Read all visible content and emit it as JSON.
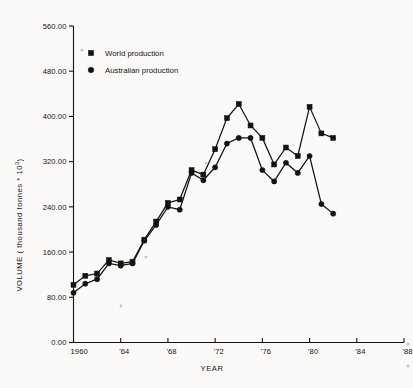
{
  "chart_data": {
    "type": "line",
    "title": "",
    "xlabel": "YEAR",
    "ylabel": "VOLUME ( thousand tonnes * 10",
    "ylabel_exponent": "3",
    "ylabel_suffix": ")",
    "xlim": [
      1960,
      1988
    ],
    "ylim": [
      0,
      560
    ],
    "grid": false,
    "legend_position": "top-left",
    "x_tick_labels": [
      "1960",
      "'64",
      "'68",
      "'72",
      "'76",
      "'80",
      "'84",
      "'88"
    ],
    "x_tick_values": [
      1960,
      1964,
      1968,
      1972,
      1976,
      1980,
      1984,
      1988
    ],
    "y_tick_labels": [
      "0.00",
      "80.00",
      "160.00",
      "240.00",
      "320.00",
      "400.00",
      "480.00",
      "560.00"
    ],
    "y_tick_values": [
      0,
      80,
      160,
      240,
      320,
      400,
      480,
      560
    ],
    "x": [
      1960,
      1961,
      1962,
      1963,
      1964,
      1965,
      1966,
      1967,
      1968,
      1969,
      1970,
      1971,
      1972,
      1973,
      1974,
      1975,
      1976,
      1977,
      1978,
      1979,
      1980,
      1981,
      1982
    ],
    "series": [
      {
        "name": "World production",
        "marker": "square",
        "values": [
          102,
          118,
          122,
          146,
          140,
          143,
          182,
          214,
          247,
          253,
          305,
          297,
          342,
          397,
          422,
          384,
          362,
          315,
          345,
          330,
          417,
          370,
          362
        ]
      },
      {
        "name": "Australian production",
        "marker": "circle",
        "values": [
          88,
          104,
          112,
          140,
          136,
          140,
          180,
          208,
          240,
          235,
          300,
          287,
          310,
          352,
          362,
          362,
          305,
          285,
          318,
          300,
          330,
          245,
          228
        ]
      }
    ]
  },
  "legend": {
    "entries": [
      {
        "label": "World production",
        "marker": "square"
      },
      {
        "label": "Australian production",
        "marker": "circle"
      }
    ]
  },
  "colors": {
    "ink": "#15120f",
    "background": "#fbfaf8"
  }
}
